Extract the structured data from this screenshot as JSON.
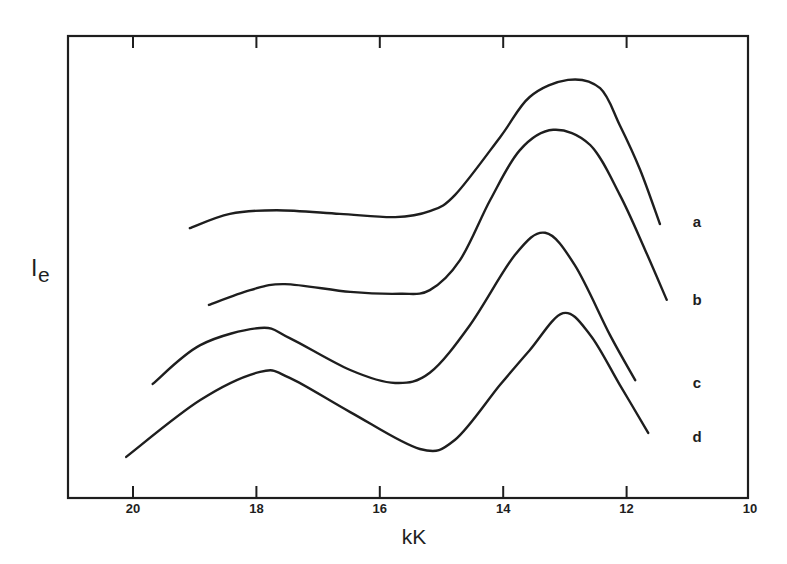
{
  "chart_data": {
    "type": "line",
    "title": "",
    "xlabel": "kK",
    "ylabel": "I",
    "ylabel_subscript": "e",
    "xlim": [
      21.0,
      10
    ],
    "x_inverted": true,
    "xticks": [
      20,
      18,
      16,
      14,
      12,
      10
    ],
    "xtick_labels": [
      "20",
      "18",
      "16",
      "14",
      "12",
      "10"
    ],
    "ylim": [
      0,
      100
    ],
    "y_units": "relative intensity (arbitrary, no ticks shown)",
    "grid": false,
    "legend": "inline labels at right end of each curve",
    "series": [
      {
        "name": "a",
        "label_pos": [
          11.0,
          60
        ],
        "x": [
          19.08,
          18.43,
          17.67,
          16.65,
          15.75,
          15.19,
          14.78,
          14.05,
          13.57,
          12.95,
          12.43,
          12.11,
          11.78,
          11.46
        ],
        "y": [
          58.4,
          61.5,
          62.3,
          61.5,
          60.8,
          62.1,
          65.6,
          78.1,
          86.8,
          90.5,
          88.7,
          80.7,
          71.0,
          59.3
        ]
      },
      {
        "name": "b",
        "label_pos": [
          11.0,
          43
        ],
        "x": [
          18.77,
          18.1,
          17.54,
          16.48,
          15.67,
          15.19,
          14.7,
          14.21,
          13.73,
          13.19,
          12.59,
          12.11,
          11.7,
          11.35
        ],
        "y": [
          41.8,
          45.0,
          46.3,
          44.6,
          44.2,
          45.0,
          51.5,
          64.5,
          75.3,
          79.7,
          76.4,
          65.6,
          53.7,
          42.9
        ]
      },
      {
        "name": "c",
        "label_pos": [
          11.0,
          25
        ],
        "x": [
          19.68,
          18.91,
          17.94,
          17.46,
          16.48,
          15.75,
          15.19,
          14.54,
          13.81,
          13.32,
          12.84,
          12.27,
          11.86
        ],
        "y": [
          24.7,
          33.1,
          36.8,
          34.6,
          27.7,
          24.9,
          27.1,
          37.4,
          52.6,
          57.4,
          50.4,
          35.3,
          25.5
        ]
      },
      {
        "name": "d",
        "label_pos": [
          11.0,
          13
        ],
        "x": [
          20.11,
          18.91,
          17.94,
          17.46,
          16.48,
          15.35,
          14.78,
          14.05,
          13.57,
          13.03,
          12.59,
          12.11,
          11.65
        ],
        "y": [
          8.9,
          21.2,
          27.3,
          26.0,
          18.6,
          10.6,
          12.6,
          24.5,
          32.0,
          40.0,
          35.3,
          24.5,
          14.1
        ]
      }
    ]
  },
  "colors": {
    "ink": "#1e1e1e",
    "background": "#ffffff"
  }
}
